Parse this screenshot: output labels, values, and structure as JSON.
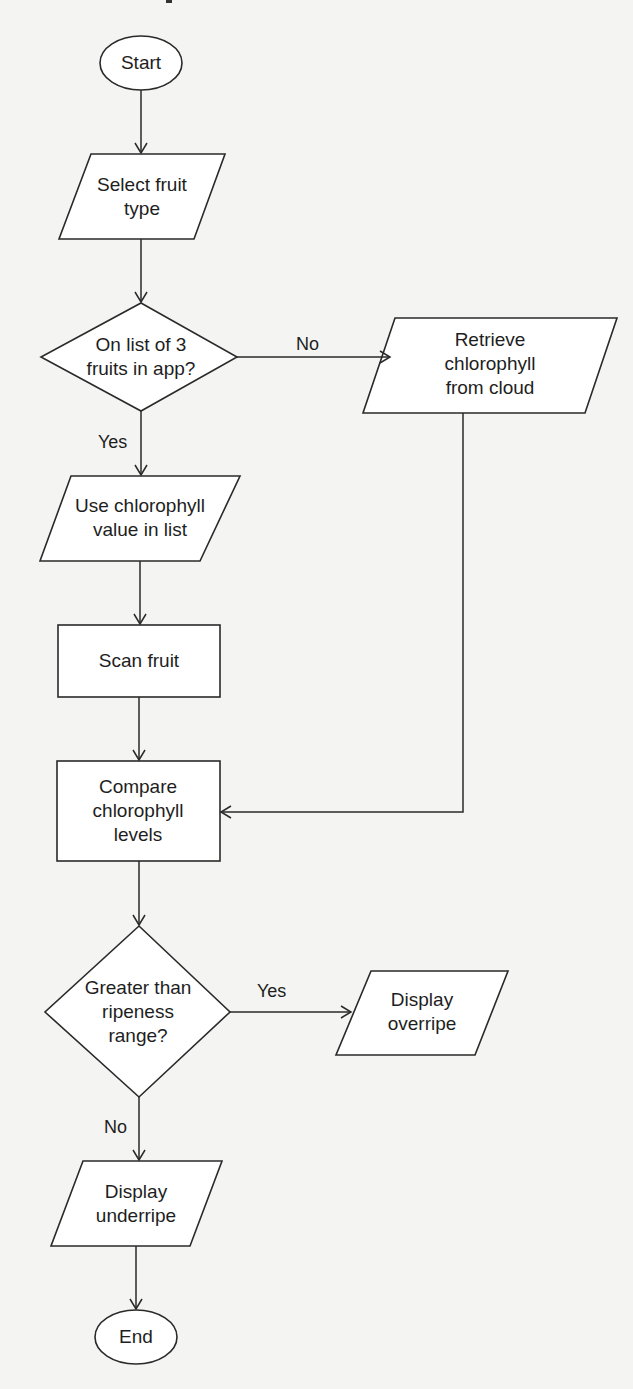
{
  "diagram": {
    "type": "flowchart",
    "nodes": {
      "start": {
        "shape": "terminator",
        "label": "Start"
      },
      "select_fruit": {
        "shape": "input-output",
        "label": "Select fruit\ntype"
      },
      "on_list": {
        "shape": "decision",
        "label": "On list of 3\nfruits in app?"
      },
      "retrieve_cloud": {
        "shape": "input-output",
        "label": "Retrieve chlorophyll\nfrom cloud"
      },
      "use_value": {
        "shape": "input-output",
        "label": "Use chlorophyll\nvalue in list"
      },
      "scan_fruit": {
        "shape": "process",
        "label": "Scan fruit"
      },
      "compare": {
        "shape": "process",
        "label": "Compare\nchlorophyll\nlevels"
      },
      "greater_than": {
        "shape": "decision",
        "label": "Greater than\nripeness\nrange?"
      },
      "display_overripe": {
        "shape": "input-output",
        "label": "Display\noverripe"
      },
      "display_underripe": {
        "shape": "input-output",
        "label": "Display\nunderripe"
      },
      "end": {
        "shape": "terminator",
        "label": "End"
      }
    },
    "edges": [
      {
        "from": "start",
        "to": "select_fruit",
        "label": ""
      },
      {
        "from": "select_fruit",
        "to": "on_list",
        "label": ""
      },
      {
        "from": "on_list",
        "to": "retrieve_cloud",
        "label": "No"
      },
      {
        "from": "on_list",
        "to": "use_value",
        "label": "Yes"
      },
      {
        "from": "use_value",
        "to": "scan_fruit",
        "label": ""
      },
      {
        "from": "scan_fruit",
        "to": "compare",
        "label": ""
      },
      {
        "from": "retrieve_cloud",
        "to": "compare",
        "label": ""
      },
      {
        "from": "compare",
        "to": "greater_than",
        "label": ""
      },
      {
        "from": "greater_than",
        "to": "display_overripe",
        "label": "Yes"
      },
      {
        "from": "greater_than",
        "to": "display_underripe",
        "label": "No"
      },
      {
        "from": "display_underripe",
        "to": "end",
        "label": ""
      }
    ],
    "edge_labels": {
      "on_list_no": "No",
      "on_list_yes": "Yes",
      "greater_yes": "Yes",
      "greater_no": "No"
    }
  }
}
